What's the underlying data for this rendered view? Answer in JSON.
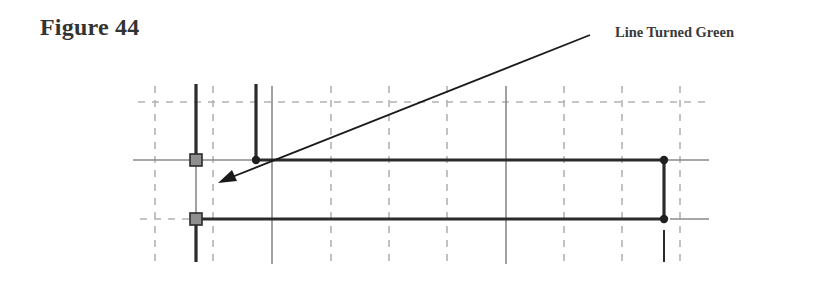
{
  "figure": {
    "title": "Figure 44",
    "callout_label": "Line Turned Green"
  },
  "colors": {
    "text": "#333333",
    "grid_dashed": "#b0b0b0",
    "thin_line": "#8a8a8a",
    "thick_line": "#2b2b2b",
    "square_fill": "#8f8f8f",
    "arrow": "#1a1a1a"
  },
  "diagram": {
    "dashed_horizontal_y": [
      102
    ],
    "dashed_vertical_x": [
      155,
      213,
      331,
      389,
      447,
      564,
      622,
      680
    ],
    "thin_solid_vertical_x": [
      272,
      506
    ],
    "endpoint_squares": [
      {
        "x": 196,
        "y": 160
      },
      {
        "x": 196,
        "y": 219
      }
    ],
    "vertex_dots": [
      {
        "x": 256,
        "y": 160
      },
      {
        "x": 664,
        "y": 160
      },
      {
        "x": 664,
        "y": 219
      }
    ],
    "arrow": {
      "from": {
        "x": 590,
        "y": 35
      },
      "to": {
        "x": 218,
        "y": 183
      }
    }
  }
}
